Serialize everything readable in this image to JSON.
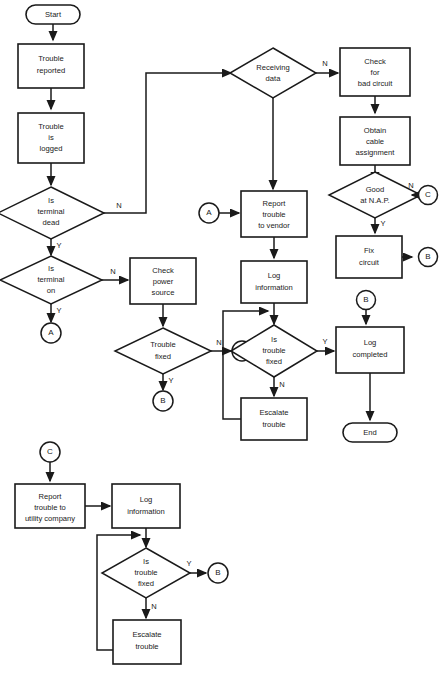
{
  "diagram": {
    "caption": "",
    "colors": {
      "stroke": "#1a1a1a",
      "fill": "#ffffff",
      "background": "#ffffff"
    },
    "nodes": {
      "start": {
        "label": "Start",
        "type": "terminator"
      },
      "trouble_reported": {
        "line1": "Trouble",
        "line2": "reported",
        "type": "process"
      },
      "trouble_logged": {
        "line1": "Trouble",
        "line2": "is",
        "line3": "logged",
        "type": "process"
      },
      "is_terminal_dead": {
        "line1": "Is",
        "line2": "terminal",
        "line3": "dead",
        "type": "decision"
      },
      "is_terminal_on": {
        "line1": "Is",
        "line2": "terminal",
        "line3": "on",
        "type": "decision"
      },
      "conn_a_left": {
        "label": "A",
        "type": "connector"
      },
      "check_power_source": {
        "line1": "Check",
        "line2": "power",
        "line3": "source",
        "type": "process"
      },
      "trouble_fixed_left": {
        "line1": "Trouble",
        "line2": "fixed",
        "type": "decision"
      },
      "conn_a_left_right": {
        "label": "A",
        "type": "connector"
      },
      "conn_b_left": {
        "label": "B",
        "type": "connector"
      },
      "receiving_data": {
        "line1": "Receiving",
        "line2": "data",
        "type": "decision"
      },
      "check_bad_circuit": {
        "line1": "Check",
        "line2": "for",
        "line3": "bad circuit",
        "type": "process"
      },
      "obtain_cable_assignment": {
        "line1": "Obtain",
        "line2": "cable",
        "line3": "assignment",
        "type": "process"
      },
      "good_at_nap": {
        "line1": "Good",
        "line2": "at N.A.P.",
        "type": "decision"
      },
      "conn_c_right": {
        "label": "C",
        "type": "connector"
      },
      "fix_circuit": {
        "line1": "Fix",
        "line2": "circuit",
        "type": "process"
      },
      "conn_b_fix": {
        "label": "B",
        "type": "connector"
      },
      "conn_a_mid": {
        "label": "A",
        "type": "connector"
      },
      "report_trouble_vendor": {
        "line1": "Report",
        "line2": "trouble",
        "line3": "to vendor",
        "type": "process"
      },
      "log_information_mid": {
        "line1": "Log",
        "line2": "information",
        "type": "process"
      },
      "is_trouble_fixed_mid": {
        "line1": "Is",
        "line2": "trouble",
        "line3": "fixed",
        "type": "decision"
      },
      "escalate_trouble_mid": {
        "line1": "Escalate",
        "line2": "trouble",
        "type": "process"
      },
      "conn_b_log": {
        "label": "B",
        "type": "connector"
      },
      "log_completed": {
        "line1": "Log",
        "line2": "completed",
        "type": "process"
      },
      "end": {
        "label": "End",
        "type": "terminator"
      },
      "conn_c_bottom": {
        "label": "C",
        "type": "connector"
      },
      "report_trouble_utility": {
        "line1": "Report",
        "line2": "trouble to",
        "line3": "utility company",
        "type": "process"
      },
      "log_information_bottom": {
        "line1": "Log",
        "line2": "information",
        "type": "process"
      },
      "is_trouble_fixed_bottom": {
        "line1": "Is",
        "line2": "trouble",
        "line3": "fixed",
        "type": "decision"
      },
      "conn_b_bottom": {
        "label": "B",
        "type": "connector"
      },
      "escalate_trouble_bottom": {
        "line1": "Escalate",
        "line2": "trouble",
        "type": "process"
      }
    },
    "edge_labels": {
      "terminal_dead_n": "N",
      "terminal_dead_y": "Y",
      "terminal_on_n": "N",
      "terminal_on_y": "Y",
      "trouble_fixed_left_n": "N",
      "trouble_fixed_left_y": "Y",
      "receiving_data_n": "N",
      "good_at_nap_n": "N",
      "good_at_nap_y": "Y",
      "trouble_fixed_mid_y": "Y",
      "trouble_fixed_mid_n": "N",
      "trouble_fixed_bottom_y": "Y",
      "trouble_fixed_bottom_n": "N"
    }
  }
}
